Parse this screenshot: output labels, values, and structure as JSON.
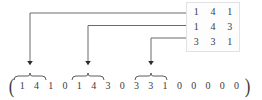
{
  "figure": {
    "type": "matrix-to-vector-mapping-diagram",
    "background_color": "#ffffff",
    "ink_color": "#3a3a3a",
    "line_color": "#555555",
    "box_border_color": "#e2e2e2"
  },
  "matrix": {
    "name": "source-matrix",
    "rows": 3,
    "cols": 3,
    "values": [
      [
        "1",
        "4",
        "1"
      ],
      [
        "1",
        "4",
        "3"
      ],
      [
        "3",
        "3",
        "1"
      ]
    ],
    "flat": [
      "1",
      "4",
      "1",
      "1",
      "4",
      "3",
      "3",
      "3",
      "1"
    ]
  },
  "vector": {
    "name": "flattened-padded-vector",
    "open_paren": "(",
    "close_paren": ")",
    "entries": [
      "1",
      "4",
      "1",
      "0",
      "1",
      "4",
      "3",
      "0",
      "3",
      "3",
      "1",
      "0",
      "0",
      "0",
      "0",
      "0"
    ],
    "length": 16
  },
  "braces": [
    {
      "label": "brace-row-1",
      "covers": "entries 1-3",
      "start_index": 0,
      "end_index": 2
    },
    {
      "label": "brace-row-2",
      "covers": "entries 5-7",
      "start_index": 4,
      "end_index": 6
    },
    {
      "label": "brace-row-3",
      "covers": "entries 9-11",
      "start_index": 8,
      "end_index": 10
    }
  ],
  "arrows": [
    {
      "label": "arrow-row-1",
      "from_matrix_row": 1,
      "to_vector_group": 1
    },
    {
      "label": "arrow-row-2",
      "from_matrix_row": 2,
      "to_vector_group": 2
    },
    {
      "label": "arrow-row-3",
      "from_matrix_row": 3,
      "to_vector_group": 3
    }
  ]
}
